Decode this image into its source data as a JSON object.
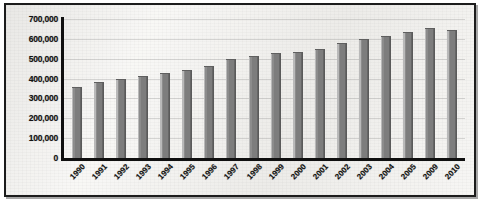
{
  "chart_data": {
    "type": "bar",
    "title": "",
    "xlabel": "",
    "ylabel": "",
    "grid": true,
    "legend": "none",
    "ylim": [
      0,
      700000
    ],
    "ytick_step": 100000,
    "ytick_labels": [
      "700,000",
      "600,000",
      "500,000",
      "400,000",
      "300,000",
      "200,000",
      "100,000",
      "0"
    ],
    "ytick_values": [
      700000,
      600000,
      500000,
      400000,
      300000,
      200000,
      100000,
      0
    ],
    "categories": [
      "1990",
      "1991",
      "1992",
      "1993",
      "1994",
      "1995",
      "1996",
      "1997",
      "1998",
      "1999",
      "2000",
      "2001",
      "2002",
      "2003",
      "2004",
      "2005",
      "2009",
      "2010"
    ],
    "values": [
      355000,
      380000,
      395000,
      408000,
      425000,
      438000,
      460000,
      492000,
      510000,
      522000,
      530000,
      545000,
      575000,
      592000,
      610000,
      628000,
      650000,
      638000
    ],
    "bar_color": "#7d7d7d",
    "axis_color": "#101010",
    "background_color": "#f4f3f0"
  },
  "frame": {
    "border_color": "#1c1c1c"
  }
}
